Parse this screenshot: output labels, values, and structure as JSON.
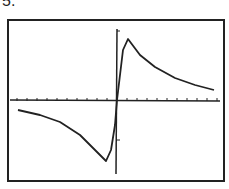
{
  "problem_label": "5.",
  "chart_data": {
    "type": "line",
    "title": "",
    "xlabel": "",
    "ylabel": "",
    "grid": false,
    "x_ticks_count_each_side": 10,
    "series": [
      {
        "name": "f(x)",
        "points_px": [
          [
            18,
            110
          ],
          [
            40,
            115
          ],
          [
            60,
            122
          ],
          [
            80,
            135
          ],
          [
            95,
            150
          ],
          [
            106,
            161
          ],
          [
            111,
            150
          ],
          [
            115,
            125
          ],
          [
            117,
            100
          ],
          [
            120,
            75
          ],
          [
            123,
            50
          ],
          [
            128,
            39
          ],
          [
            140,
            55
          ],
          [
            155,
            67
          ],
          [
            175,
            78
          ],
          [
            195,
            85
          ],
          [
            214,
            90
          ]
        ]
      }
    ],
    "features": {
      "minimum": "left of origin, below x-axis",
      "maximum": "right of origin, above x-axis",
      "symmetry": "origin (odd function)",
      "asymptote": "y = 0 horizontal"
    }
  }
}
